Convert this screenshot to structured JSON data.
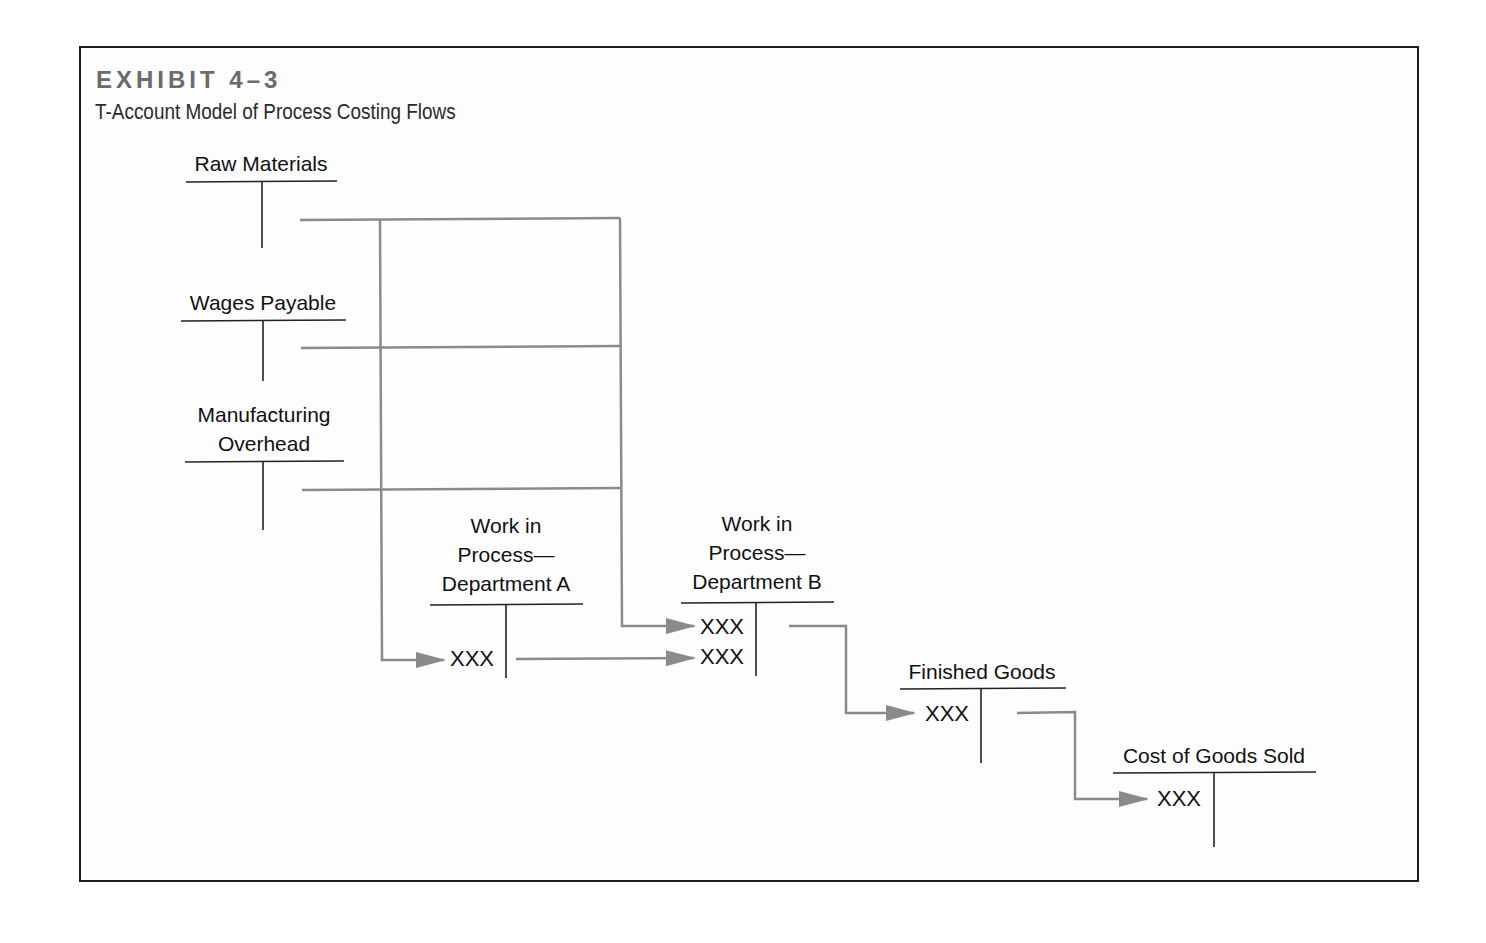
{
  "exhibit": {
    "number_label": "EXHIBIT 4–3",
    "title": "T-Account Model of Process Costing Flows"
  },
  "accounts": [
    {
      "id": "raw-materials",
      "label": "Raw Materials",
      "entries": []
    },
    {
      "id": "wages-payable",
      "label": "Wages Payable",
      "entries": []
    },
    {
      "id": "manufacturing-overhead",
      "label_lines": [
        "Manufacturing",
        "Overhead"
      ],
      "entries": []
    },
    {
      "id": "wip-dept-a",
      "label_lines": [
        "Work in",
        "Process—",
        "Department A"
      ],
      "entries": [
        "XXX"
      ]
    },
    {
      "id": "wip-dept-b",
      "label_lines": [
        "Work in",
        "Process—",
        "Department B"
      ],
      "entries": [
        "XXX",
        "XXX"
      ]
    },
    {
      "id": "finished-goods",
      "label": "Finished Goods",
      "entries": [
        "XXX"
      ]
    },
    {
      "id": "cost-of-goods-sold",
      "label": "Cost of Goods Sold",
      "entries": [
        "XXX"
      ]
    }
  ],
  "flows": [
    {
      "from": "Raw Materials",
      "to": "Work in Process—Department A"
    },
    {
      "from": "Wages Payable",
      "to": "Work in Process—Department A"
    },
    {
      "from": "Manufacturing Overhead",
      "to": "Work in Process—Department A"
    },
    {
      "from": "Raw Materials",
      "to": "Work in Process—Department B"
    },
    {
      "from": "Wages Payable",
      "to": "Work in Process—Department B"
    },
    {
      "from": "Manufacturing Overhead",
      "to": "Work in Process—Department B"
    },
    {
      "from": "Work in Process—Department A",
      "to": "Work in Process—Department B"
    },
    {
      "from": "Work in Process—Department B",
      "to": "Finished Goods"
    },
    {
      "from": "Finished Goods",
      "to": "Cost of Goods Sold"
    }
  ],
  "colors": {
    "frame": "#1c1c1c",
    "flow_line": "#8a8a8a",
    "t_account_line": "#222222",
    "exhibit_label": "#6b6b6b"
  }
}
